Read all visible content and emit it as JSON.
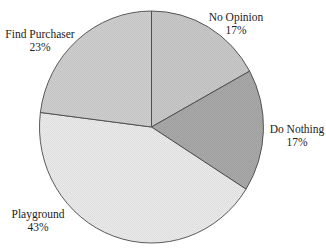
{
  "chart_data": {
    "type": "pie",
    "title": "",
    "start_angle_deg": 0,
    "direction": "clockwise",
    "categories": [
      "No Opinion",
      "Do Nothing",
      "Playground",
      "Find Purchaser"
    ],
    "values": [
      17,
      17,
      43,
      23
    ],
    "value_labels": [
      "17%",
      "17%",
      "43%",
      "23%"
    ],
    "colors": [
      "#c9c9c9",
      "#a9a9a9",
      "#ebebeb",
      "#cfcfcf"
    ],
    "legend": "none",
    "labels_position": "outside"
  },
  "labels": [
    {
      "name": "No Opinion",
      "pct": "17%"
    },
    {
      "name": "Do Nothing",
      "pct": "17%"
    },
    {
      "name": "Playground",
      "pct": "43%"
    },
    {
      "name": "Find Purchaser",
      "pct": "23%"
    }
  ]
}
